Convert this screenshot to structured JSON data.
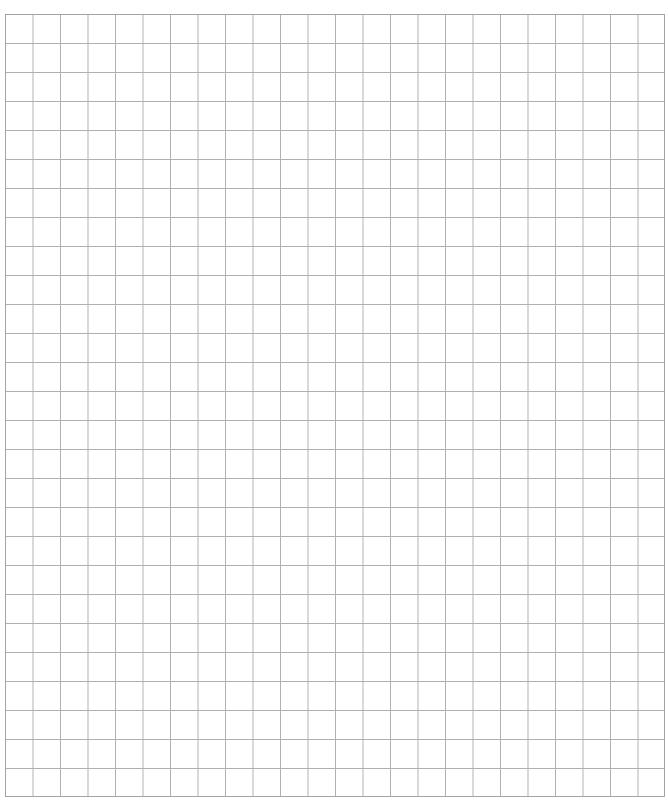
{
  "page": {
    "title_partial": "",
    "title_note": "Title text at top is cut off; only descenders visible"
  },
  "grid": {
    "columns": 24,
    "rows": 27,
    "line_color": "#b0b0b0",
    "border_color": "#a3a3a3",
    "cell_width_px": 27.5,
    "cell_height_px": 29
  }
}
